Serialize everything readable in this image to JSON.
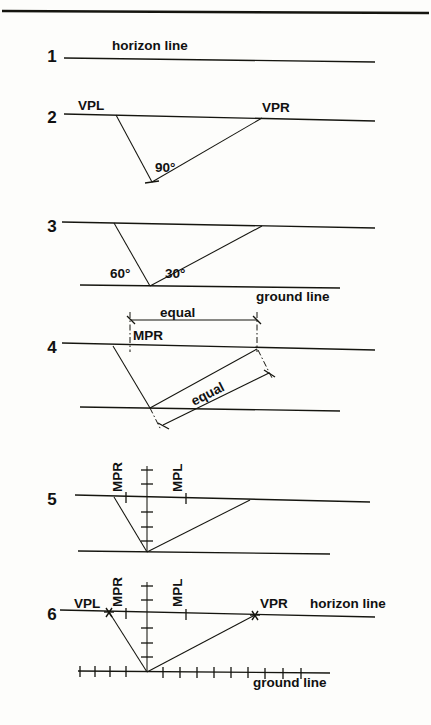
{
  "figure": {
    "background_color": "#fdfdfb",
    "ink_color": "#15150f",
    "width": 431,
    "height": 725
  },
  "panels": [
    {
      "id": "panel-1",
      "number": "1",
      "number_x": 52,
      "number_y": 62,
      "horizon": {
        "x1": 64,
        "y1": 58,
        "x2": 375,
        "y2": 62
      },
      "labels": [
        {
          "name": "horizon-line-label",
          "text": "horizon line",
          "x": 112,
          "y": 50,
          "size": 13.5
        }
      ]
    },
    {
      "id": "panel-2",
      "number": "2",
      "number_x": 52,
      "number_y": 123,
      "horizon": {
        "x1": 64,
        "y1": 114,
        "x2": 375,
        "y2": 121
      },
      "apex": {
        "x": 152,
        "y": 182
      },
      "vpl": {
        "x": 116,
        "y": 115
      },
      "vpr": {
        "x": 262,
        "y": 118
      },
      "labels": [
        {
          "name": "vpl-label",
          "text": "VPL",
          "x": 78,
          "y": 110,
          "size": 13.5
        },
        {
          "name": "vpr-label",
          "text": "VPR",
          "x": 262,
          "y": 112,
          "size": 13.5
        },
        {
          "name": "angle-90-label",
          "text": "90°",
          "x": 155,
          "y": 172,
          "size": 13.5
        }
      ]
    },
    {
      "id": "panel-3",
      "number": "3",
      "number_x": 52,
      "number_y": 232,
      "horizon": {
        "x1": 62,
        "y1": 222,
        "x2": 375,
        "y2": 228
      },
      "ground": {
        "x1": 80,
        "y1": 285,
        "x2": 340,
        "y2": 288
      },
      "apex": {
        "x": 150,
        "y": 286
      },
      "vpl": {
        "x": 114,
        "y": 223
      },
      "vpr": {
        "x": 262,
        "y": 226
      },
      "labels": [
        {
          "name": "angle-60-label",
          "text": "60°",
          "x": 110,
          "y": 278,
          "size": 13.5
        },
        {
          "name": "angle-30-label",
          "text": "30°",
          "x": 165,
          "y": 278,
          "size": 13.5
        },
        {
          "name": "ground-line-label",
          "text": "ground line",
          "x": 256,
          "y": 301,
          "size": 13.5
        }
      ]
    },
    {
      "id": "panel-4",
      "number": "4",
      "number_x": 52,
      "number_y": 353,
      "horizon": {
        "x1": 62,
        "y1": 343,
        "x2": 375,
        "y2": 350
      },
      "second_line": {
        "x1": 80,
        "y1": 407,
        "x2": 340,
        "y2": 411
      },
      "mpr_x": 130,
      "right_drop_x": 257,
      "apex": {
        "x": 150,
        "y": 408
      },
      "vpl": {
        "x": 113,
        "y": 346
      },
      "labels": [
        {
          "name": "equal-horizontal-label",
          "text": "equal",
          "x": 160,
          "y": 317,
          "size": 13.5
        },
        {
          "name": "mpr-label",
          "text": "MPR",
          "x": 133,
          "y": 340,
          "size": 13.5
        },
        {
          "name": "equal-diagonal-label",
          "text": "equal",
          "x": 194,
          "y": 406,
          "size": 13.5,
          "rotate": -27
        }
      ],
      "dimension_horizontal": {
        "x1": 130,
        "y1": 320,
        "x2": 257,
        "y2": 320
      },
      "dimension_diagonal": {
        "x1": 162,
        "y1": 426,
        "x2": 270,
        "y2": 372
      }
    },
    {
      "id": "panel-5",
      "number": "5",
      "number_x": 52,
      "number_y": 505,
      "horizon": {
        "x1": 75,
        "y1": 495,
        "x2": 370,
        "y2": 502
      },
      "ground": {
        "x1": 78,
        "y1": 551,
        "x2": 330,
        "y2": 554
      },
      "axis_x": 147,
      "axis_y_top": 466,
      "apex": {
        "x": 147,
        "y": 552
      },
      "vpl": {
        "x": 114,
        "y": 497
      },
      "vpr": {
        "x": 250,
        "y": 500
      },
      "mpr_x": 126,
      "mpl_x": 186,
      "labels": [
        {
          "name": "mpr-label",
          "text": "MPR",
          "x": 122,
          "y": 492,
          "size": 13.5,
          "rotate": -90
        },
        {
          "name": "mpl-label",
          "text": "MPL",
          "x": 182,
          "y": 492,
          "size": 13.5,
          "rotate": -90
        }
      ]
    },
    {
      "id": "panel-6",
      "number": "6",
      "number_x": 52,
      "number_y": 620,
      "horizon": {
        "x1": 60,
        "y1": 610,
        "x2": 375,
        "y2": 617
      },
      "ground": {
        "x1": 78,
        "y1": 671,
        "x2": 330,
        "y2": 673
      },
      "axis_x": 147,
      "axis_y_top": 582,
      "apex": {
        "x": 147,
        "y": 672
      },
      "vpl": {
        "x": 109,
        "y": 612
      },
      "vpr": {
        "x": 255,
        "y": 615
      },
      "mpr_x": 126,
      "mpl_x": 186,
      "labels": [
        {
          "name": "vpl-label",
          "text": "VPL",
          "x": 74,
          "y": 608,
          "size": 13.5
        },
        {
          "name": "mpr-label",
          "text": "MPR",
          "x": 122,
          "y": 607,
          "size": 13.5,
          "rotate": -90
        },
        {
          "name": "mpl-label",
          "text": "MPL",
          "x": 182,
          "y": 607,
          "size": 13.5,
          "rotate": -90
        },
        {
          "name": "vpr-label",
          "text": "VPR",
          "x": 260,
          "y": 608,
          "size": 13.5
        },
        {
          "name": "horizon-line-label",
          "text": "horizon line",
          "x": 310,
          "y": 608,
          "size": 13.5
        },
        {
          "name": "ground-line-label",
          "text": "ground line",
          "x": 253,
          "y": 687,
          "size": 13.5
        }
      ]
    }
  ],
  "annotations": {
    "horizon_line": "horizon line",
    "ground_line": "ground line",
    "equal": "equal",
    "vpl": "VPL",
    "vpr": "VPR",
    "mpr": "MPR",
    "mpl": "MPL",
    "angle_90": "90°",
    "angle_60": "60°",
    "angle_30": "30°"
  },
  "frame": {
    "top_border": {
      "x1": 2,
      "y1": 10,
      "x2": 429,
      "y2": 13
    }
  }
}
